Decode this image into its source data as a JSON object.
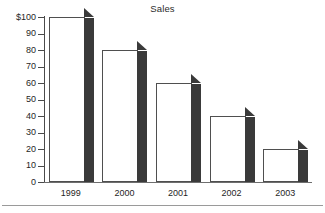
{
  "chart_data": {
    "type": "bar",
    "title": "Sales",
    "xlabel": "",
    "ylabel": "",
    "categories": [
      "1999",
      "2000",
      "2001",
      "2002",
      "2003"
    ],
    "values": [
      100,
      80,
      60,
      40,
      20
    ],
    "ylim": [
      0,
      100
    ],
    "ytick_values": [
      0,
      10,
      20,
      30,
      40,
      50,
      60,
      70,
      80,
      90,
      100
    ],
    "ytick_labels": [
      "0",
      "10",
      "20",
      "30",
      "40",
      "50",
      "60",
      "70",
      "80",
      "90",
      "$100"
    ],
    "grid": false,
    "legend": null,
    "style": {
      "bar_face_color": "#ffffff",
      "bar_edge_color": "#4f4f4f",
      "bar_side_color": "#3a3a3a",
      "axis_color": "#4a4a4a",
      "text_color": "#1f1f1f",
      "background": "#ffffff",
      "three_d": true
    }
  }
}
